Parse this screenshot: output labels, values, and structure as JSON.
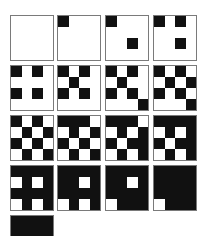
{
  "figure": {
    "colors": {
      "ink": "#111111",
      "paper": "#ffffff",
      "border": "#7a7a7a"
    },
    "tiles": [
      {
        "level": 0,
        "rows": [
          "0000",
          "0000",
          "0000",
          "0000"
        ]
      },
      {
        "level": 1,
        "rows": [
          "1000",
          "0000",
          "0000",
          "0000"
        ]
      },
      {
        "level": 2,
        "rows": [
          "1000",
          "0000",
          "0010",
          "0000"
        ]
      },
      {
        "level": 3,
        "rows": [
          "1010",
          "0000",
          "0010",
          "0000"
        ]
      },
      {
        "level": 4,
        "rows": [
          "1010",
          "0000",
          "1010",
          "0000"
        ]
      },
      {
        "level": 5,
        "rows": [
          "1010",
          "0100",
          "1010",
          "0000"
        ]
      },
      {
        "level": 6,
        "rows": [
          "1010",
          "0100",
          "1010",
          "0001"
        ]
      },
      {
        "level": 7,
        "rows": [
          "1010",
          "0101",
          "1010",
          "0001"
        ]
      },
      {
        "level": 8,
        "rows": [
          "1010",
          "0101",
          "1010",
          "0101"
        ]
      },
      {
        "level": 9,
        "rows": [
          "1110",
          "0101",
          "1010",
          "0101"
        ]
      },
      {
        "level": 10,
        "rows": [
          "1110",
          "0101",
          "1011",
          "0101"
        ]
      },
      {
        "level": 11,
        "rows": [
          "1111",
          "0101",
          "1011",
          "0101"
        ]
      },
      {
        "level": 12,
        "rows": [
          "1111",
          "0101",
          "1111",
          "0101"
        ]
      },
      {
        "level": 13,
        "rows": [
          "1111",
          "1101",
          "1111",
          "0101"
        ]
      },
      {
        "level": 14,
        "rows": [
          "1111",
          "1101",
          "1111",
          "0111"
        ]
      },
      {
        "level": 15,
        "rows": [
          "1111",
          "1111",
          "1111",
          "0111"
        ]
      },
      {
        "level": 16,
        "rows": [
          "1111",
          "1111",
          "1111",
          "1111"
        ]
      }
    ]
  }
}
